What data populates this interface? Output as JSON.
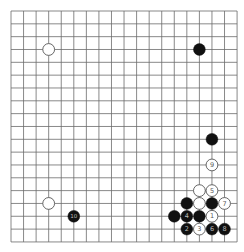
{
  "board": {
    "size": 19,
    "origin_x": 11,
    "origin_y": 11,
    "spacing_x": 12.56,
    "spacing_y": 12.83,
    "line_color": "#6b6b6b",
    "background": "#ffffff",
    "stone_radius": 5.9
  },
  "colors": {
    "black_stone": "#111111",
    "white_stone": "#ffffff",
    "white_stone_border": "#555555",
    "label_on_black": "#bbbbbb",
    "label_on_white": "#555555"
  },
  "stones": [
    {
      "col": 3,
      "row": 3,
      "color": "white",
      "label": ""
    },
    {
      "col": 15,
      "row": 3,
      "color": "black",
      "label": ""
    },
    {
      "col": 16,
      "row": 10,
      "color": "black",
      "label": ""
    },
    {
      "col": 16,
      "row": 12,
      "color": "white",
      "label": "9"
    },
    {
      "col": 15,
      "row": 14,
      "color": "white",
      "label": ""
    },
    {
      "col": 16,
      "row": 14,
      "color": "white",
      "label": "5"
    },
    {
      "col": 14,
      "row": 15,
      "color": "black",
      "label": ""
    },
    {
      "col": 15,
      "row": 15,
      "color": "white",
      "label": ""
    },
    {
      "col": 16,
      "row": 15,
      "color": "black",
      "label": ""
    },
    {
      "col": 17,
      "row": 15,
      "color": "white",
      "label": "7"
    },
    {
      "col": 13,
      "row": 16,
      "color": "black",
      "label": ""
    },
    {
      "col": 14,
      "row": 16,
      "color": "black",
      "label": "4"
    },
    {
      "col": 15,
      "row": 16,
      "color": "black",
      "label": ""
    },
    {
      "col": 16,
      "row": 16,
      "color": "white",
      "label": "1"
    },
    {
      "col": 14,
      "row": 17,
      "color": "black",
      "label": "2"
    },
    {
      "col": 15,
      "row": 17,
      "color": "white",
      "label": "3"
    },
    {
      "col": 16,
      "row": 17,
      "color": "black",
      "label": "6"
    },
    {
      "col": 17,
      "row": 17,
      "color": "black",
      "label": "8"
    },
    {
      "col": 3,
      "row": 15,
      "color": "white",
      "label": ""
    },
    {
      "col": 5,
      "row": 16,
      "color": "black",
      "label": "10"
    }
  ]
}
